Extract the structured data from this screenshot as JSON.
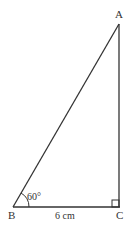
{
  "diagram": {
    "type": "right-triangle",
    "vertices": {
      "A": {
        "label": "A"
      },
      "B": {
        "label": "B"
      },
      "C": {
        "label": "C"
      }
    },
    "angle_B_label": "60°",
    "side_BC_label": "6 cm",
    "right_angle_at": "C",
    "line_color": "#333333"
  }
}
